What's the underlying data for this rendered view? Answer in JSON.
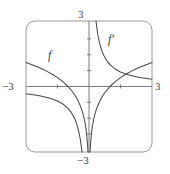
{
  "figure": {
    "kind": "cartesian-graph",
    "top_artifact_text": "",
    "frame": {
      "shape": "rounded-rectangle",
      "x_min_px": 26,
      "x_max_px": 152,
      "y_min_px": 21,
      "y_max_px": 152,
      "corner_radius_px": 9,
      "stroke": "#8f8f8f"
    },
    "axis_labels": {
      "top": "3",
      "bottom": "−3",
      "left": "−3",
      "right": "3"
    },
    "curve_labels": {
      "f": "f",
      "f_prime": "f′"
    },
    "colors": {
      "frame": "#8f8f8f",
      "axis": "#6e6e6e",
      "curve": "#4a4a4a",
      "background": "#ffffff",
      "label_text": "#3f3f3f"
    }
  },
  "chart_data": {
    "type": "line",
    "title": "",
    "xlabel": "",
    "ylabel": "",
    "xlim": [
      -3,
      3
    ],
    "ylim": [
      -3,
      3
    ],
    "grid": false,
    "legend_position": "inline-curve-labels",
    "x_tick_labels": [
      "−3",
      "3"
    ],
    "y_tick_labels": [
      "−3",
      "3"
    ],
    "x_tick_values": [
      -3,
      -1.5,
      1.5,
      3
    ],
    "y_tick_values": [
      -3,
      -1.5,
      1.5,
      3
    ],
    "unlabeled_tick_values": [
      -1.5,
      1.5
    ],
    "annotations": [
      {
        "text": "f",
        "x": -1.6,
        "y": 1.55
      },
      {
        "text": "f′",
        "x": 1.0,
        "y": 2.2
      }
    ],
    "series": [
      {
        "name": "f",
        "label": "f",
        "formula": "ln|x|",
        "color": "#4a4a4a",
        "branches": [
          {
            "domain": [
              -3,
              -0.02
            ],
            "x": [
              -3.0,
              -2.75,
              -2.5,
              -2.25,
              -2.0,
              -1.75,
              -1.5,
              -1.25,
              -1.0,
              -0.85,
              -0.7,
              -0.55,
              -0.45,
              -0.35,
              -0.28,
              -0.22,
              -0.16,
              -0.11,
              -0.07,
              -0.05,
              -0.035,
              -0.025
            ],
            "y": [
              1.099,
              1.012,
              0.916,
              0.811,
              0.693,
              0.56,
              0.405,
              0.223,
              0.0,
              -0.163,
              -0.357,
              -0.598,
              -0.799,
              -1.05,
              -1.273,
              -1.514,
              -1.833,
              -2.207,
              -2.659,
              -3.0,
              -3.0,
              -3.0
            ]
          },
          {
            "domain": [
              0.02,
              3
            ],
            "x": [
              0.025,
              0.035,
              0.05,
              0.07,
              0.11,
              0.16,
              0.22,
              0.28,
              0.35,
              0.45,
              0.55,
              0.7,
              0.85,
              1.0,
              1.25,
              1.5,
              1.75,
              2.0,
              2.25,
              2.5,
              2.75,
              3.0
            ],
            "y": [
              -3.0,
              -3.0,
              -3.0,
              -2.659,
              -2.207,
              -1.833,
              -1.514,
              -1.273,
              -1.05,
              -0.799,
              -0.598,
              -0.357,
              -0.163,
              0.0,
              0.223,
              0.405,
              0.56,
              0.693,
              0.811,
              0.916,
              1.012,
              1.099
            ]
          }
        ]
      },
      {
        "name": "f'",
        "label": "f′",
        "formula": "1/x",
        "color": "#4a4a4a",
        "branches": [
          {
            "domain": [
              -3,
              -0.33
            ],
            "x": [
              -3.0,
              -2.75,
              -2.5,
              -2.25,
              -2.0,
              -1.75,
              -1.5,
              -1.25,
              -1.0,
              -0.85,
              -0.7,
              -0.6,
              -0.5,
              -0.42,
              -0.36,
              -0.3333
            ],
            "y": [
              -0.333,
              -0.364,
              -0.4,
              -0.444,
              -0.5,
              -0.571,
              -0.667,
              -0.8,
              -1.0,
              -1.176,
              -1.429,
              -1.667,
              -2.0,
              -2.381,
              -2.778,
              -3.0
            ]
          },
          {
            "domain": [
              0.33,
              3
            ],
            "x": [
              0.3333,
              0.36,
              0.42,
              0.5,
              0.6,
              0.7,
              0.85,
              1.0,
              1.25,
              1.5,
              1.75,
              2.0,
              2.25,
              2.5,
              2.75,
              3.0
            ],
            "y": [
              3.0,
              2.778,
              2.381,
              2.0,
              1.667,
              1.429,
              1.176,
              1.0,
              0.8,
              0.667,
              0.571,
              0.5,
              0.444,
              0.4,
              0.364,
              0.333
            ]
          }
        ]
      }
    ],
    "intersections": [
      {
        "x": 1.763,
        "y": 0.567
      }
    ]
  }
}
